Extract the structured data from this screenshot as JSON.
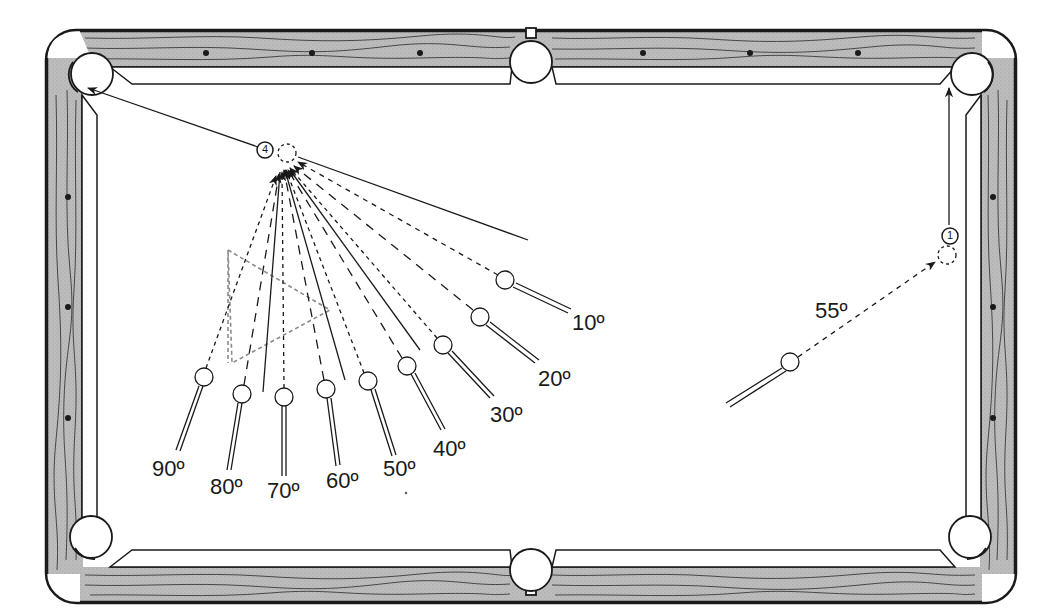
{
  "diagram": {
    "type": "pool-table-shot-angles",
    "colors": {
      "rail_wood": "#b8b8b8",
      "rail_grain": "#3a3a3a",
      "outline": "#1a1a1a",
      "cloth": "#ffffff",
      "ghost_outline": "#8a8a8a"
    },
    "object_balls": [
      {
        "number": "4",
        "x": 265,
        "y": 150,
        "target_pocket": "top-left-corner"
      },
      {
        "number": "1",
        "x": 950,
        "y": 236,
        "target_pocket": "top-right-corner"
      }
    ],
    "cut_angle_labels": [
      {
        "text": "10º",
        "x": 572,
        "y": 312
      },
      {
        "text": "20º",
        "x": 538,
        "y": 368
      },
      {
        "text": "30º",
        "x": 490,
        "y": 404
      },
      {
        "text": "40º",
        "x": 433,
        "y": 438
      },
      {
        "text": "50º",
        "x": 383,
        "y": 458
      },
      {
        "text": "60º",
        "x": 326,
        "y": 470
      },
      {
        "text": "70º",
        "x": 267,
        "y": 480
      },
      {
        "text": "80º",
        "x": 210,
        "y": 476
      },
      {
        "text": "90º",
        "x": 152,
        "y": 458
      },
      {
        "text": "55º",
        "x": 815,
        "y": 300
      }
    ],
    "cue_balls": [
      {
        "angle": "10º",
        "x": 505,
        "y": 280
      },
      {
        "angle": "20º",
        "x": 480,
        "y": 317
      },
      {
        "angle": "30º",
        "x": 443,
        "y": 345
      },
      {
        "angle": "40º",
        "x": 407,
        "y": 366
      },
      {
        "angle": "50º",
        "x": 368,
        "y": 381
      },
      {
        "angle": "60º",
        "x": 326,
        "y": 389
      },
      {
        "angle": "70º",
        "x": 284,
        "y": 397
      },
      {
        "angle": "80º",
        "x": 242,
        "y": 394
      },
      {
        "angle": "90º",
        "x": 204,
        "y": 377
      },
      {
        "angle": "55º",
        "x": 790,
        "y": 362
      }
    ]
  }
}
